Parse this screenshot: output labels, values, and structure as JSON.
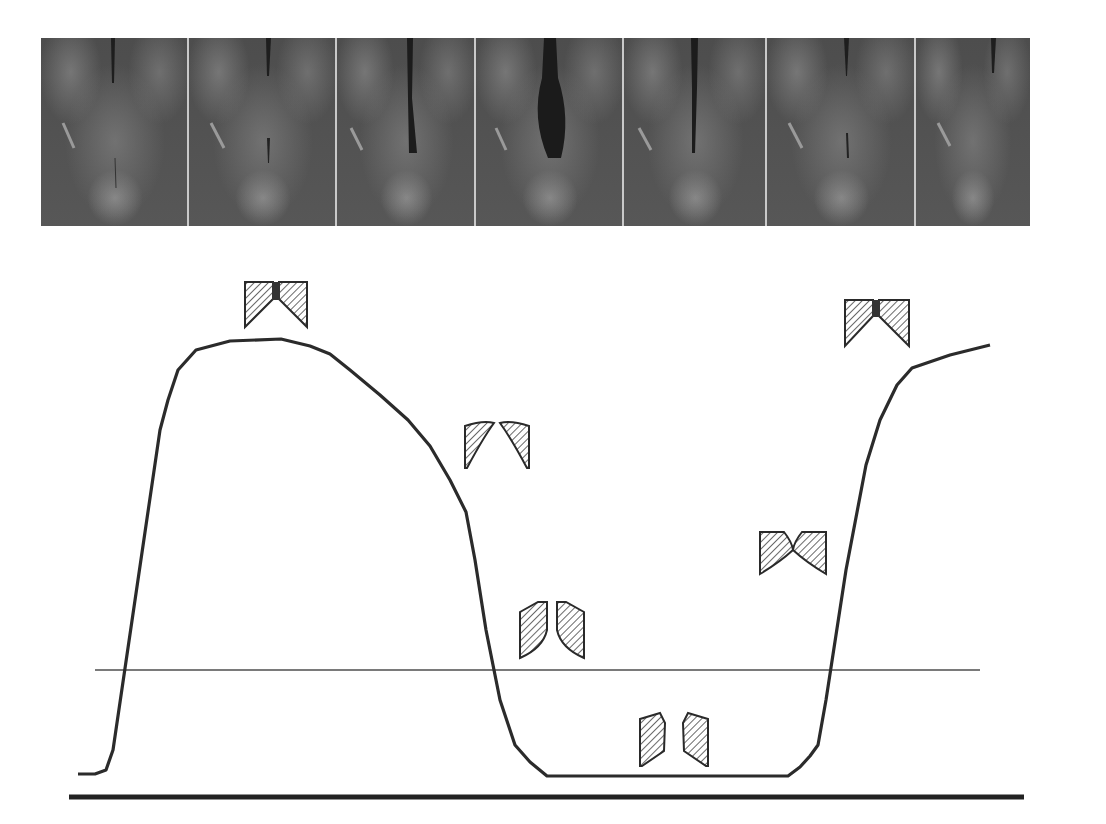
{
  "figure": {
    "image_strip": {
      "frame_count": 7,
      "frames": [
        {
          "index": 1,
          "glottis_opening": 0.05
        },
        {
          "index": 2,
          "glottis_opening": 0.25
        },
        {
          "index": 3,
          "glottis_opening": 0.55
        },
        {
          "index": 4,
          "glottis_opening": 1.0
        },
        {
          "index": 5,
          "glottis_opening": 0.45
        },
        {
          "index": 6,
          "glottis_opening": 0.2
        },
        {
          "index": 7,
          "glottis_opening": 0.0
        }
      ]
    },
    "schematics": [
      {
        "name": "fold-schematic-1",
        "phase": "closed, upper edges meet",
        "x": 243,
        "y": 279
      },
      {
        "name": "fold-schematic-2",
        "phase": "opening from below",
        "x": 463,
        "y": 418
      },
      {
        "name": "fold-schematic-3",
        "phase": "open, parallel",
        "x": 518,
        "y": 600
      },
      {
        "name": "fold-schematic-4",
        "phase": "maximally open",
        "x": 638,
        "y": 711
      },
      {
        "name": "fold-schematic-5",
        "phase": "closing, convergent",
        "x": 758,
        "y": 530
      },
      {
        "name": "fold-schematic-6",
        "phase": "closed",
        "x": 843,
        "y": 298
      }
    ],
    "colors": {
      "curve": "#2b2b2b",
      "threshold_line": "#7a7a7a",
      "baseline": "#222222",
      "hatch": "#333333"
    }
  },
  "chart_data": {
    "type": "line",
    "title": "",
    "xlabel": "",
    "ylabel": "",
    "grid": false,
    "series": [
      {
        "name": "waveform",
        "points_px": [
          [
            78,
            774
          ],
          [
            95,
            774
          ],
          [
            106,
            770
          ],
          [
            113,
            750
          ],
          [
            160,
            430
          ],
          [
            168,
            400
          ],
          [
            178,
            370
          ],
          [
            196,
            350
          ],
          [
            230,
            341
          ],
          [
            281,
            339
          ],
          [
            310,
            346
          ],
          [
            330,
            354
          ],
          [
            350,
            370
          ],
          [
            380,
            395
          ],
          [
            408,
            420
          ],
          [
            430,
            446
          ],
          [
            450,
            480
          ],
          [
            466,
            512
          ],
          [
            475,
            560
          ],
          [
            486,
            630
          ],
          [
            500,
            700
          ],
          [
            515,
            745
          ],
          [
            530,
            762
          ],
          [
            547,
            776
          ],
          [
            788,
            776
          ],
          [
            800,
            767
          ],
          [
            810,
            756
          ],
          [
            818,
            745
          ],
          [
            826,
            700
          ],
          [
            846,
            570
          ],
          [
            866,
            465
          ],
          [
            880,
            420
          ],
          [
            897,
            385
          ],
          [
            912,
            368
          ],
          [
            950,
            355
          ],
          [
            990,
            345
          ]
        ]
      }
    ],
    "reference_lines": [
      {
        "name": "threshold",
        "y_px": 670,
        "x_from": 95,
        "x_to": 980
      },
      {
        "name": "baseline",
        "y_px": 797,
        "x_from": 69,
        "x_to": 1024
      }
    ]
  }
}
